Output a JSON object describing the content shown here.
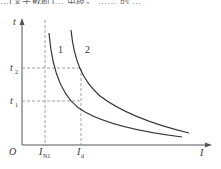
{
  "header_fragment": "…(文字截断)… 电缆。 …… 的 …",
  "diagram": {
    "type": "time-current characteristic curves",
    "axes": {
      "x_label": "I",
      "y_label": "t",
      "origin_label": "O"
    },
    "curves": [
      {
        "id": "1",
        "label": "1"
      },
      {
        "id": "2",
        "label": "2"
      }
    ],
    "x_markers": [
      {
        "main": "I",
        "sub": "N1"
      },
      {
        "main": "I",
        "sub": "d"
      }
    ],
    "y_markers": [
      {
        "main": "t",
        "sub": "2"
      },
      {
        "main": "t",
        "sub": "1"
      }
    ],
    "colors": {
      "axis": "#555555",
      "curve": "#333333",
      "dashed": "#888888"
    }
  }
}
